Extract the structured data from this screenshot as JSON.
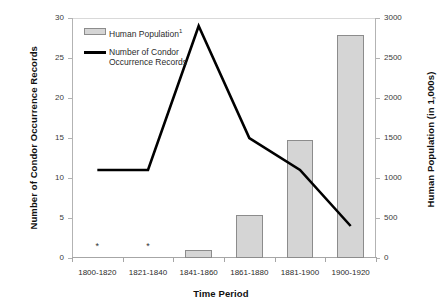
{
  "chart_data": {
    "type": "bar",
    "title": "",
    "xlabel": "Time Period",
    "categories": [
      "1800-1820",
      "1821-1840",
      "1841-1860",
      "1861-1880",
      "1881-1900",
      "1900-1920"
    ],
    "grid": false,
    "legend_position": "top-left",
    "axes": {
      "left": {
        "label": "Number of Condor Occurrence Records",
        "ylim": [
          0,
          30
        ],
        "ticks": [
          0,
          5,
          10,
          15,
          20,
          25,
          30
        ],
        "tick_labels": [
          "0",
          "5",
          "10",
          "15",
          "20",
          "25",
          "30"
        ]
      },
      "right": {
        "label": "Human Population (in 1,000s)",
        "ylim": [
          0,
          3000
        ],
        "ticks": [
          0,
          500,
          1000,
          1500,
          2000,
          2500,
          3000
        ],
        "tick_labels": [
          "0",
          "500",
          "1000",
          "1500",
          "2000",
          "2500",
          "3000"
        ]
      }
    },
    "series": [
      {
        "name": "Human Population",
        "legend_label": "Human Population",
        "legend_superscript": "1",
        "type": "bar",
        "axis": "right",
        "color": "#d5d5d5",
        "border_color": "#8c8c8c",
        "values": [
          0,
          0,
          100,
          540,
          1480,
          2790
        ]
      },
      {
        "name": "Number of Condor Occurrence Records",
        "legend_label": "Number of Condor\nOccurrence Records",
        "type": "line",
        "axis": "left",
        "color": "#000000",
        "values": [
          11,
          11,
          29,
          15,
          11,
          4
        ]
      }
    ],
    "annotations": [
      {
        "symbol": "*",
        "category": "1800-1820",
        "note": "no data"
      },
      {
        "symbol": "*",
        "category": "1821-1840",
        "note": "no data"
      }
    ]
  }
}
